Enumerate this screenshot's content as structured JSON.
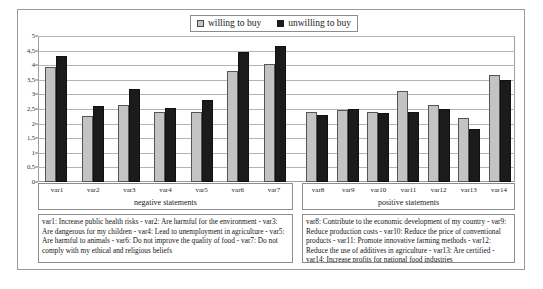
{
  "legend": {
    "items": [
      {
        "label": "willing to buy",
        "swatch": "light-gray-square",
        "color": "#c3c3c3"
      },
      {
        "label": "unwilling to buy",
        "swatch": "black-square",
        "color": "#1b1b1b"
      }
    ]
  },
  "axes": {
    "y_ticks": [
      "0",
      "0,5",
      "1",
      "1,5",
      "2",
      "2,5",
      "3",
      "3,5",
      "4",
      "4,5",
      "5"
    ],
    "negative_group_title": "negative statements",
    "positive_group_title": "positive statements"
  },
  "captions": {
    "negative": "var1: Increase public health risks - var2: Are harmful for the environment - var3: Are dangerous for my children - var4: Lead to unemployment in agriculture - var5: Are harmful to animals - var6: Do not improve the quality of food - var7: Do not comply with my ethical and religious beliefs",
    "positive": "var8: Contribute to the economic development of my country - var9: Reduce production costs - var10: Reduce the price of conventional products - var11: Promote innovative farming methods - var12: Reduce the use of additives in agriculture - var13: Are certified - var14: Increase profits for national food industries"
  },
  "chart_data": {
    "type": "bar",
    "title": "",
    "xlabel": "",
    "ylabel": "",
    "ylim": [
      0,
      5
    ],
    "ytick_step": 0.5,
    "grid": true,
    "legend_position": "top-center",
    "groups": [
      {
        "name": "negative statements",
        "categories": [
          "var1",
          "var2",
          "var3",
          "var4",
          "var5",
          "var6",
          "var7"
        ],
        "series": [
          {
            "name": "willing to buy",
            "values": [
              3.95,
              2.25,
              2.65,
              2.4,
              2.4,
              3.8,
              4.05
            ]
          },
          {
            "name": "unwilling to buy",
            "values": [
              4.3,
              2.6,
              3.2,
              2.55,
              2.8,
              4.45,
              4.65
            ]
          }
        ]
      },
      {
        "name": "positive statements",
        "categories": [
          "var8",
          "var9",
          "var10",
          "var11",
          "var12",
          "var13",
          "var14"
        ],
        "series": [
          {
            "name": "willing to buy",
            "values": [
              2.4,
              2.45,
              2.4,
              3.1,
              2.65,
              2.2,
              3.65
            ]
          },
          {
            "name": "unwilling to buy",
            "values": [
              2.3,
              2.5,
              2.35,
              2.4,
              2.5,
              1.8,
              3.5
            ]
          }
        ]
      }
    ]
  }
}
